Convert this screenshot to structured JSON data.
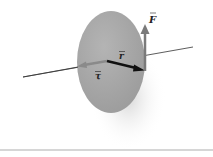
{
  "diagram": {
    "labels": {
      "force": "F",
      "radius": "r",
      "torque": "τ"
    },
    "colors": {
      "disc": "#a8a8a8",
      "shadow": "#e4e4e4",
      "axis": "#333333",
      "r_vector": "#111111",
      "torque_vector": "#8a8a8a",
      "force_vector": "#7a7a7a",
      "baseline": "#c8c8c8"
    }
  }
}
